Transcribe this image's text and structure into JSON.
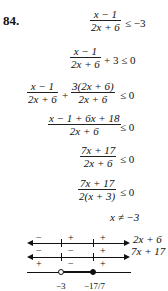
{
  "problem": {
    "number": "84.",
    "steps": [
      {
        "num": "x − 1",
        "den": "2x + 6",
        "rel": "≤ −3"
      },
      {
        "num": "x − 1",
        "den": "2x + 6",
        "rel": "+ 3 ≤ 0"
      },
      {
        "num1": "x − 1",
        "den1": "2x + 6",
        "op": "+",
        "num2": "3(2x + 6)",
        "den2": "2x + 6",
        "rel": "≤ 0"
      },
      {
        "num": "x − 1 + 6x + 18",
        "den": "2x + 6",
        "rel": "≤ 0"
      },
      {
        "num": "7x + 17",
        "den": "2x + 6",
        "rel": "≤ 0"
      },
      {
        "num": "7x + 17",
        "den": "2(x + 3)",
        "rel": "≤ 0"
      }
    ],
    "restriction": "x ≠ −3"
  },
  "sign_chart": {
    "rows": [
      {
        "factor": "2x + 6",
        "signs": [
          "−",
          "+",
          "+"
        ]
      },
      {
        "factor": "7x + 17",
        "signs": [
          "−",
          "−",
          "+"
        ]
      },
      {
        "factor": "",
        "signs": [
          "+",
          "−",
          "+"
        ]
      }
    ],
    "critical_points": [
      {
        "label": "−3",
        "type": "open"
      },
      {
        "label": "−17/7",
        "type": "closed"
      }
    ]
  }
}
